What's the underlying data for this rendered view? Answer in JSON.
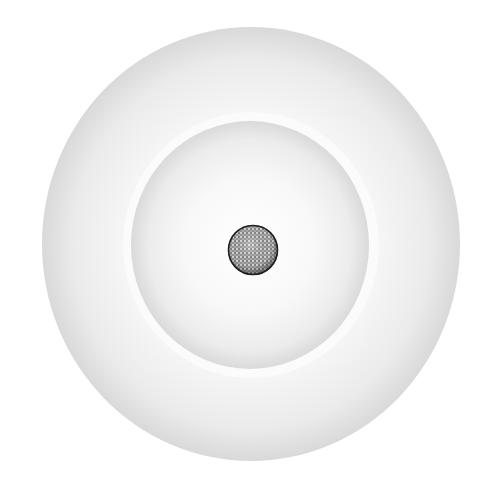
{
  "diagram": {
    "type": "concentric-shells",
    "center": {
      "x": 252,
      "y": 246
    },
    "outer_shell": {
      "cx": 252,
      "cy": 244,
      "r": 212,
      "edge_color": "#d6d6d6",
      "inner_color": "#fbfbfb"
    },
    "gap_ring": {
      "cx": 252,
      "cy": 245,
      "r": 126,
      "color": "#ffffff"
    },
    "inner_shell": {
      "cx": 250,
      "cy": 245,
      "r": 123,
      "edge_color": "#d4d4d4",
      "inner_color": "#fcfcfc"
    },
    "nucleus": {
      "cx": 253,
      "cy": 250,
      "r": 25,
      "fill_color": "#8a8a8a",
      "stroke_color": "#222222",
      "pattern": "stippled"
    }
  }
}
